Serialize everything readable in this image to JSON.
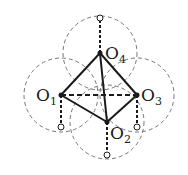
{
  "diagram": {
    "points": [
      {
        "id": "O1",
        "label": "O",
        "sub": "1",
        "x": 61,
        "y": 95,
        "label_x": 36,
        "label_y": 101,
        "anchor_x": 61,
        "anchor_y": 127
      },
      {
        "id": "O2",
        "label": "O",
        "sub": "2",
        "x": 107,
        "y": 122,
        "label_x": 110,
        "label_y": 139,
        "anchor_x": 107,
        "anchor_y": 155
      },
      {
        "id": "O3",
        "label": "O",
        "sub": "3",
        "x": 137,
        "y": 95,
        "label_x": 141,
        "label_y": 101,
        "anchor_x": 137,
        "anchor_y": 127
      },
      {
        "id": "O4",
        "label": "O",
        "sub": "4",
        "x": 100,
        "y": 53,
        "label_x": 105,
        "label_y": 59,
        "anchor_x": 100,
        "anchor_y": 18
      }
    ],
    "circle_radius": 37,
    "solid_edges": [
      [
        "O1",
        "O4"
      ],
      [
        "O4",
        "O3"
      ],
      [
        "O1",
        "O2"
      ],
      [
        "O2",
        "O3"
      ],
      [
        "O4",
        "O2"
      ]
    ],
    "dashed_edges": [
      [
        "O1",
        "O3"
      ]
    ],
    "colors": {
      "stroke": "#1a1a1a",
      "dashed_circle": "#777777"
    }
  }
}
